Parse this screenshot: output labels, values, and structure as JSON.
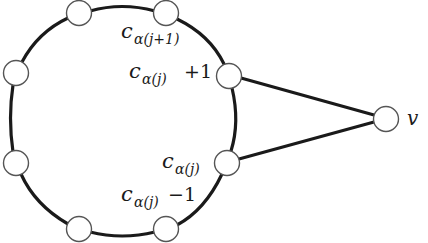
{
  "diagram": {
    "type": "graph",
    "colors": {
      "edge": "#1a1a1a",
      "node_fill": "#ffffff",
      "node_stroke": "#555555",
      "background": "#ffffff"
    },
    "nodes": [
      {
        "id": "n-top-left",
        "x": 79,
        "y": 13
      },
      {
        "id": "n-top-right",
        "x": 166,
        "y": 13
      },
      {
        "id": "n-c-alpha-j-plus-1",
        "x": 229,
        "y": 76
      },
      {
        "id": "n-c-alpha-j",
        "x": 227,
        "y": 163
      },
      {
        "id": "n-bottom-right",
        "x": 166,
        "y": 229
      },
      {
        "id": "n-bottom-left",
        "x": 79,
        "y": 229
      },
      {
        "id": "n-left-lower",
        "x": 16,
        "y": 163
      },
      {
        "id": "n-left-upper",
        "x": 16,
        "y": 73
      },
      {
        "id": "v",
        "x": 386,
        "y": 119
      }
    ],
    "labels": {
      "c_alpha_j1": {
        "base": "c",
        "sub": "α(j+1)"
      },
      "c_alpha_j_plus_1": {
        "base": "c",
        "sub": "α(j)",
        "suffix": "+1"
      },
      "c_alpha_j": {
        "base": "c",
        "sub": "α(j)"
      },
      "c_alpha_j_minus_1": {
        "base": "c",
        "sub": "α(j)",
        "suffix": "−1"
      },
      "v": "v"
    }
  }
}
